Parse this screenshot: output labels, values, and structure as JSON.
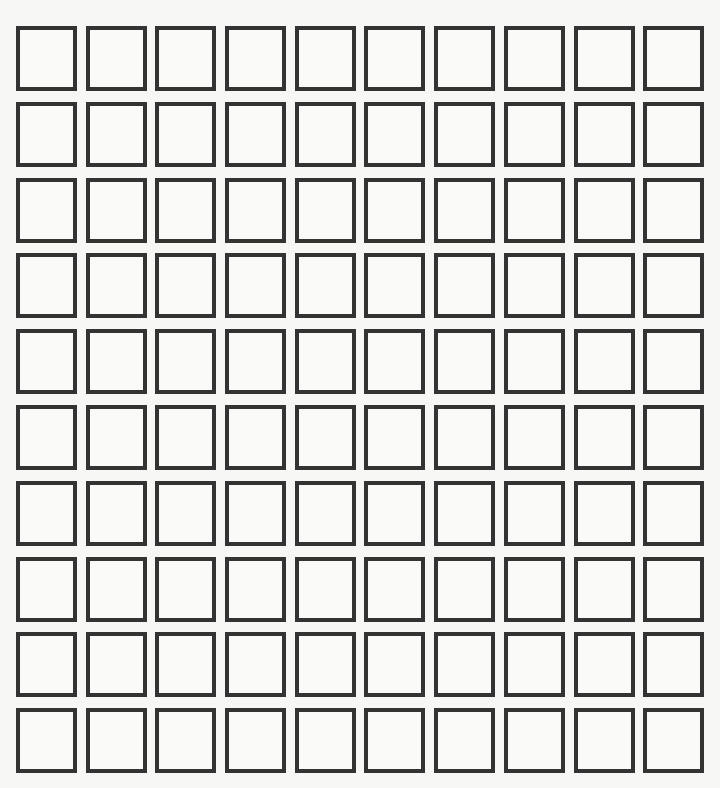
{
  "grid": {
    "rows": 10,
    "columns": 10,
    "cells_filled": 0,
    "border_color": "#333333",
    "background_color": "#f7f7f6"
  }
}
